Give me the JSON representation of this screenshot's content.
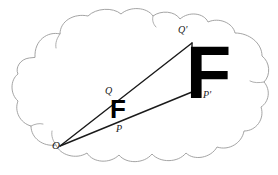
{
  "figure": {
    "background_color": "#ffffff",
    "cloud": {
      "name": "cloud-outline",
      "stroke_color": "#9a9a9a",
      "stroke_width": 0.9,
      "fill": "none"
    },
    "rays": {
      "stroke_color": "#1a1a1a",
      "stroke_width": 1.4,
      "origin_label": "O",
      "origin": [
        60,
        146
      ],
      "segments": [
        {
          "name": "ray-o-to-qprime",
          "from": [
            60,
            146
          ],
          "to": [
            192,
            43
          ]
        },
        {
          "name": "ray-o-to-pprime",
          "from": [
            60,
            146
          ],
          "to": [
            192,
            92
          ]
        },
        {
          "name": "segment-qprime-pprime",
          "from": [
            192,
            43
          ],
          "to": [
            192,
            92
          ]
        }
      ]
    },
    "glyphs": [
      {
        "name": "letter-f-small",
        "text": "F",
        "size_px": 26,
        "position": [
          110,
          96
        ]
      },
      {
        "name": "letter-f-large",
        "text": "F",
        "size_px": 74,
        "position": [
          186,
          36
        ]
      }
    ],
    "labels": [
      {
        "name": "label-o",
        "text": "O",
        "position": [
          52,
          140
        ],
        "font_size": 11
      },
      {
        "name": "label-q",
        "text": "Q",
        "position": [
          105,
          86
        ],
        "font_size": 10
      },
      {
        "name": "label-p",
        "text": "P",
        "position": [
          116,
          124
        ],
        "font_size": 10
      },
      {
        "name": "label-q-prime",
        "text": "Q'",
        "position": [
          178,
          25
        ],
        "font_size": 10
      },
      {
        "name": "label-p-prime",
        "text": "P'",
        "position": [
          203,
          90
        ],
        "font_size": 10
      }
    ]
  }
}
